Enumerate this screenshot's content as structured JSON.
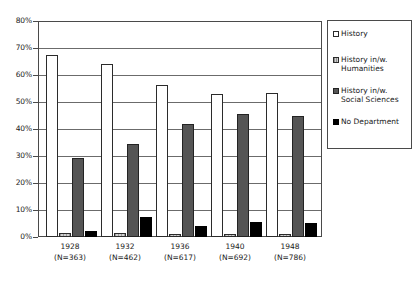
{
  "chart_data": {
    "type": "bar",
    "title": "",
    "subtitle": "",
    "xlabel": "",
    "ylabel": "",
    "ylim": [
      0,
      80
    ],
    "y_ticks": [
      "0%",
      "10%",
      "20%",
      "30%",
      "40%",
      "50%",
      "60%",
      "70%",
      "80%"
    ],
    "y_tick_values": [
      0,
      10,
      20,
      30,
      40,
      50,
      60,
      70,
      80
    ],
    "grid": true,
    "legend_position": "right",
    "categories": [
      "1928",
      "1932",
      "1936",
      "1940",
      "1948"
    ],
    "category_sublabels": [
      "(N=363)",
      "(N=462)",
      "(N=617)",
      "(N=692)",
      "(N=786)"
    ],
    "series": [
      {
        "name": "History",
        "color": "#ffffff",
        "values": [
          67.3,
          64.2,
          56.2,
          53.1,
          53.4
        ]
      },
      {
        "name": "History in/w. Humanities",
        "color": "#cfcfcf",
        "values": [
          1.6,
          1.6,
          1.3,
          1.0,
          1.1
        ]
      },
      {
        "name": "History in/w. Social Sciences",
        "color": "#555555",
        "values": [
          29.4,
          34.3,
          41.8,
          45.4,
          44.9
        ]
      },
      {
        "name": "No Department",
        "color": "#000000",
        "values": [
          2.2,
          7.5,
          4.1,
          5.7,
          5.3
        ]
      }
    ]
  },
  "legend": {
    "items": [
      {
        "label": "History",
        "swatch": "white-swatch"
      },
      {
        "label": "History in/w.\nHumanities",
        "swatch": "light-gray-swatch"
      },
      {
        "label": "History in/w.\nSocial Sciences",
        "swatch": "dark-gray-swatch"
      },
      {
        "label": "No Department",
        "swatch": "black-swatch"
      }
    ]
  }
}
